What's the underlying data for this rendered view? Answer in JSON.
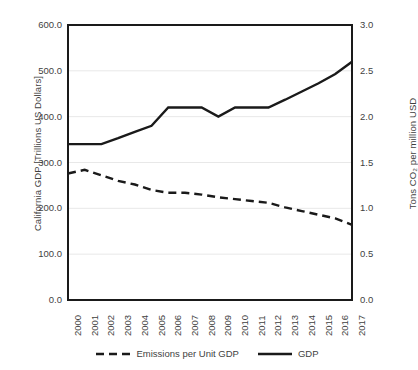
{
  "chart_data": {
    "type": "line",
    "title": "",
    "xlabel": "",
    "ylabel": "California GDP [Trillions US Dollars]",
    "ylabel_secondary": "Tons CO₂ per million USD",
    "categories": [
      "2000",
      "2001",
      "2002",
      "2003",
      "2004",
      "2005",
      "2006",
      "2007",
      "2008",
      "2009",
      "2010",
      "2011",
      "2012",
      "2013",
      "2014",
      "2015",
      "2016",
      "2017"
    ],
    "ylim": [
      0,
      600
    ],
    "yticks": [
      "0.0",
      "100.0",
      "200.0",
      "300.0",
      "400.0",
      "500.0",
      "600.0"
    ],
    "ytick_values": [
      0,
      100,
      200,
      300,
      400,
      500,
      600
    ],
    "ylim_secondary": [
      0,
      3.0
    ],
    "yticks_secondary": [
      "0.0",
      "0.5",
      "1.0",
      "1.5",
      "2.0",
      "2.5",
      "3.0"
    ],
    "ytick_values_secondary": [
      0,
      0.5,
      1.0,
      1.5,
      2.0,
      2.5,
      3.0
    ],
    "grid": true,
    "grid_axis": "y",
    "legend_position": "bottom",
    "series": [
      {
        "name": "Emissions per Unit GDP",
        "axis": "secondary",
        "style": "dashed",
        "color": "#1a1a1a",
        "values": [
          1.38,
          1.42,
          1.36,
          1.3,
          1.26,
          1.2,
          1.17,
          1.17,
          1.15,
          1.12,
          1.1,
          1.08,
          1.06,
          1.01,
          0.97,
          0.93,
          0.89,
          0.82
        ],
        "values_left_scale": [
          276,
          284,
          272,
          260,
          252,
          240,
          234,
          234,
          230,
          224,
          220,
          216,
          212,
          202,
          194,
          186,
          178,
          164
        ]
      },
      {
        "name": "GDP",
        "axis": "primary",
        "style": "solid",
        "color": "#1a1a1a",
        "values": [
          340,
          340,
          340,
          353,
          367,
          380,
          420,
          420,
          420,
          400,
          420,
          420,
          420,
          437,
          455,
          473,
          493,
          520
        ]
      }
    ]
  },
  "legend": {
    "items": [
      {
        "label": "Emissions per Unit GDP",
        "style": "dashed"
      },
      {
        "label": "GDP",
        "style": "solid"
      }
    ]
  },
  "colors": {
    "line": "#1a1a1a",
    "grid": "#e8e8e8",
    "frame": "#1a1a1a",
    "text": "#3f3f3f",
    "background": "#ffffff"
  }
}
